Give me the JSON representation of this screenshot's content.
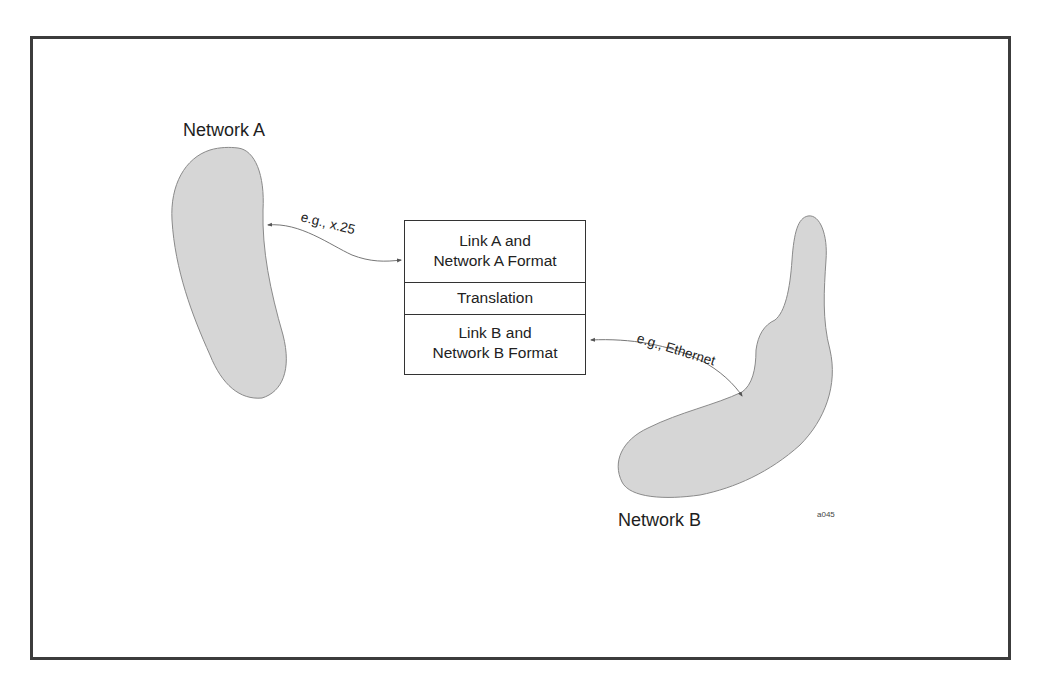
{
  "diagram": {
    "networks": [
      {
        "id": "network-a",
        "label": "Network A",
        "fill": "#d6d6d6"
      },
      {
        "id": "network-b",
        "label": "Network B",
        "fill": "#d6d6d6"
      }
    ],
    "gateway_stack": {
      "layers": [
        {
          "line1": "Link A and",
          "line2": "Network A Format"
        },
        {
          "line1": "Translation"
        },
        {
          "line1": "Link B and",
          "line2": "Network B Format"
        }
      ]
    },
    "links": [
      {
        "label": "e.g., x.25",
        "from": "network-a",
        "to": "gateway_stack.layer_1"
      },
      {
        "label": "e.g., Ethernet",
        "from": "gateway_stack.layer_3",
        "to": "network-b"
      }
    ],
    "figure_id": "a045",
    "colors": {
      "frame": "#3c3c3c",
      "blob_fill": "#d6d6d6",
      "blob_stroke": "#8a8a8a",
      "text": "#1e1e1e"
    }
  }
}
